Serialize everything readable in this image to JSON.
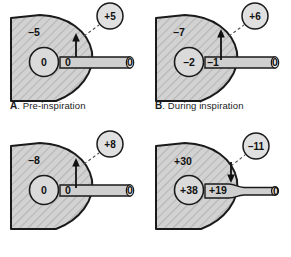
{
  "figure": {
    "units": "cm H2O",
    "colors": {
      "lung_fill": "#d2d2d2",
      "hatch_line": "#b4b4b4",
      "outline": "#1a1a1a",
      "alveolus_fill": "#d8d8d8",
      "airway_fill": "#cfcfcf",
      "badge_fill": "#e0e0e0",
      "text": "#111111",
      "background": "#ffffff"
    }
  },
  "panels": [
    {
      "id": "a",
      "caption_letter": "A",
      "caption_text": ". Pre-inspiration",
      "caption_visible": true,
      "alveolar_pressure": "0",
      "pleural_pressure": "–5",
      "airway_pressure": "0",
      "mouth_pressure": "0",
      "transmural_badge": "+5",
      "effort_arrow": "up",
      "arrow_size": "small",
      "airway_shape": "open"
    },
    {
      "id": "b",
      "caption_letter": "B",
      "caption_text": ". During inspiration",
      "caption_visible": true,
      "alveolar_pressure": "–2",
      "pleural_pressure": "–7",
      "airway_pressure": "–1",
      "mouth_pressure": "0",
      "transmural_badge": "+6",
      "effort_arrow": "up",
      "arrow_size": "large",
      "airway_shape": "open"
    },
    {
      "id": "c",
      "caption_letter": "",
      "caption_text": "",
      "caption_visible": false,
      "alveolar_pressure": "0",
      "pleural_pressure": "–8",
      "airway_pressure": "0",
      "mouth_pressure": "0",
      "transmural_badge": "+8",
      "effort_arrow": "up",
      "arrow_size": "large",
      "airway_shape": "open"
    },
    {
      "id": "d",
      "caption_letter": "",
      "caption_text": "",
      "caption_visible": false,
      "alveolar_pressure": "+38",
      "pleural_pressure": "+30",
      "airway_pressure": "+19",
      "mouth_pressure": "0",
      "transmural_badge": "–11",
      "effort_arrow": "down",
      "arrow_size": "small",
      "airway_shape": "compressed"
    }
  ]
}
